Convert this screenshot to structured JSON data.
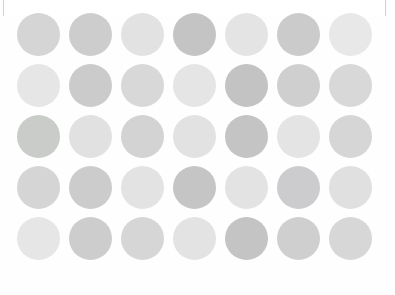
{
  "panel": {
    "background_color": "#fefefe",
    "border_color": "#d2d2d2",
    "corner_radius_px": 18
  },
  "swatch_grid": {
    "columns": 7,
    "rows": 5,
    "dot_diameter_px": 43,
    "column_gap_px": 9,
    "row_gap_px": 8,
    "palette": {
      "lightest": "#e9e9e9",
      "lighter": "#e2e2e2",
      "light": "#dcdcdc",
      "medium": "#d5d5d5",
      "medium_dark": "#cdcdcd",
      "dark": "#c8c8c8",
      "darkest": "#c2c2c2"
    },
    "rows_data": [
      {
        "index": 1,
        "dots": [
          {
            "column": 1,
            "color": "#d5d5d5",
            "tone": "medium"
          },
          {
            "column": 2,
            "color": "#cdcdcd",
            "tone": "medium_dark"
          },
          {
            "column": 3,
            "color": "#e2e2e2",
            "tone": "lighter"
          },
          {
            "column": 4,
            "color": "#c4c4c4",
            "tone": "darkest"
          },
          {
            "column": 5,
            "color": "#e4e4e4",
            "tone": "lighter"
          },
          {
            "column": 6,
            "color": "#cbcbcb",
            "tone": "dark"
          },
          {
            "column": 7,
            "color": "#e8e8e8",
            "tone": "lightest"
          }
        ]
      },
      {
        "index": 2,
        "dots": [
          {
            "column": 1,
            "color": "#e6e6e6",
            "tone": "lightest"
          },
          {
            "column": 2,
            "color": "#cbcbcb",
            "tone": "dark"
          },
          {
            "column": 3,
            "color": "#d8d8d8",
            "tone": "medium"
          },
          {
            "column": 4,
            "color": "#e5e5e5",
            "tone": "lighter"
          },
          {
            "column": 5,
            "color": "#c3c3c3",
            "tone": "darkest"
          },
          {
            "column": 6,
            "color": "#cfcfcf",
            "tone": "medium_dark"
          },
          {
            "column": 7,
            "color": "#d8d8d8",
            "tone": "medium"
          }
        ]
      },
      {
        "index": 3,
        "dots": [
          {
            "column": 1,
            "color": "#caccca",
            "tone": "dark"
          },
          {
            "column": 2,
            "color": "#e1e1e1",
            "tone": "lighter"
          },
          {
            "column": 3,
            "color": "#d3d3d3",
            "tone": "medium"
          },
          {
            "column": 4,
            "color": "#e2e2e2",
            "tone": "lighter"
          },
          {
            "column": 5,
            "color": "#c4c4c4",
            "tone": "darkest"
          },
          {
            "column": 6,
            "color": "#e4e4e4",
            "tone": "lightest"
          },
          {
            "column": 7,
            "color": "#d6d6d6",
            "tone": "medium"
          }
        ]
      },
      {
        "index": 4,
        "dots": [
          {
            "column": 1,
            "color": "#d5d5d5",
            "tone": "medium"
          },
          {
            "column": 2,
            "color": "#cccccc",
            "tone": "medium_dark"
          },
          {
            "column": 3,
            "color": "#e3e3e3",
            "tone": "lighter"
          },
          {
            "column": 4,
            "color": "#c5c5c5",
            "tone": "darkest"
          },
          {
            "column": 5,
            "color": "#e3e3e3",
            "tone": "lighter"
          },
          {
            "column": 6,
            "color": "#ccccce",
            "tone": "dark"
          },
          {
            "column": 7,
            "color": "#e0e0e0",
            "tone": "lightest"
          }
        ]
      },
      {
        "index": 5,
        "dots": [
          {
            "column": 1,
            "color": "#e6e6e6",
            "tone": "lightest"
          },
          {
            "column": 2,
            "color": "#cdcdcd",
            "tone": "dark"
          },
          {
            "column": 3,
            "color": "#d6d6d6",
            "tone": "medium"
          },
          {
            "column": 4,
            "color": "#e3e3e3",
            "tone": "lighter"
          },
          {
            "column": 5,
            "color": "#c4c4c4",
            "tone": "darkest"
          },
          {
            "column": 6,
            "color": "#cfcfcf",
            "tone": "medium_dark"
          },
          {
            "column": 7,
            "color": "#d7d7d7",
            "tone": "medium"
          }
        ]
      }
    ]
  }
}
